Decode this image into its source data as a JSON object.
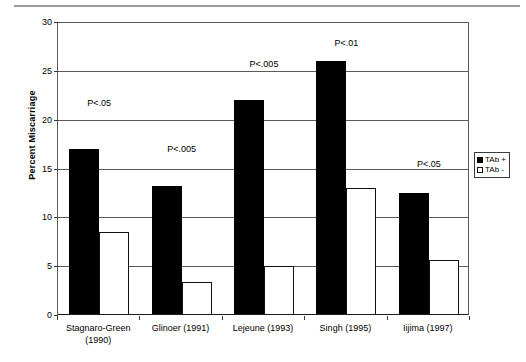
{
  "chart_data": {
    "type": "bar",
    "title": "",
    "xlabel": "",
    "ylabel": "Percent Miscarriage",
    "ylim": [
      0,
      30
    ],
    "yticks": [
      0,
      5,
      10,
      15,
      20,
      25,
      30
    ],
    "grid": true,
    "legend_position": "right",
    "categories": [
      "Stagnaro-Green\n(1990)",
      "Glinoer (1991)",
      "Lejeune (1993)",
      "Singh (1995)",
      "Iijima (1997)"
    ],
    "series": [
      {
        "name": "TAb +",
        "color": "#000000",
        "values": [
          17.0,
          13.2,
          22.0,
          26.0,
          12.5
        ]
      },
      {
        "name": "TAb -",
        "color": "#ffffff",
        "values": [
          8.5,
          3.4,
          5.0,
          13.0,
          5.6
        ]
      }
    ],
    "annotations": [
      {
        "text": "P<.05",
        "category": "Stagnaro-Green (1990)",
        "value": 22.2
      },
      {
        "text": "P<.005",
        "category": "Glinoer (1991)",
        "value": 17.5
      },
      {
        "text": "P<.005",
        "category": "Lejeune (1993)",
        "value": 26.2
      },
      {
        "text": "P<.01",
        "category": "Singh (1995)",
        "value": 28.4
      },
      {
        "text": "P<.05",
        "category": "Iijima (1997)",
        "value": 16.0
      }
    ]
  },
  "legend": {
    "items": [
      {
        "label": "TAb +"
      },
      {
        "label": "TAb -"
      }
    ]
  }
}
